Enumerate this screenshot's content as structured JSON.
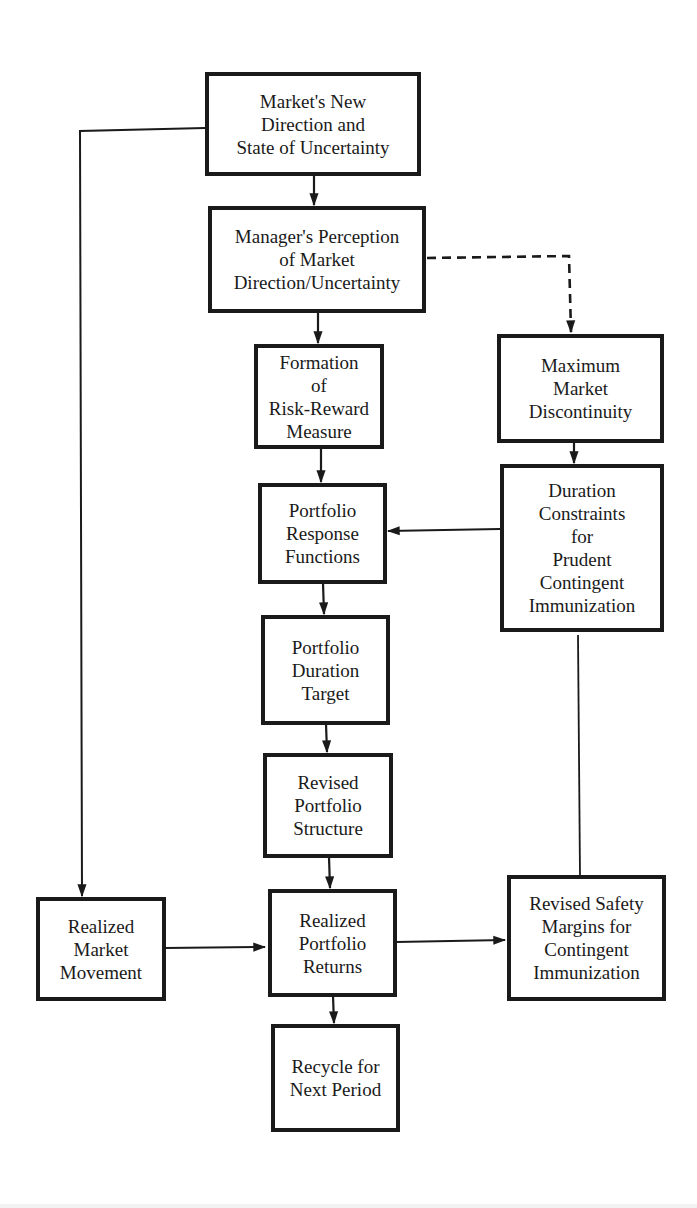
{
  "diagram": {
    "type": "flowchart",
    "colors": {
      "background": "#ffffff",
      "ink": "#1a1a1a"
    },
    "nodes": {
      "market_new_direction": {
        "label": "Market's New\nDirection  and\nState of Uncertainty"
      },
      "manager_perception": {
        "label": "Manager's Perception\nof  Market\nDirection/Uncertainty"
      },
      "risk_reward": {
        "label": "Formation\nof\nRisk-Reward\nMeasure"
      },
      "max_discontinuity": {
        "label": "Maximum\nMarket\nDiscontinuity"
      },
      "response_functions": {
        "label": "Portfolio\nResponse\nFunctions"
      },
      "duration_constraints": {
        "label": "Duration\nConstraints\nfor\nPrudent\nContingent\nImmunization"
      },
      "duration_target": {
        "label": "Portfolio\nDuration\nTarget"
      },
      "revised_structure": {
        "label": "Revised\nPortfolio\nStructure"
      },
      "realized_market": {
        "label": "Realized\nMarket\nMovement"
      },
      "realized_returns": {
        "label": "Realized\nPortfolio\nReturns"
      },
      "safety_margins": {
        "label": "Revised Safety\nMargins for\nContingent\nImmunization"
      },
      "recycle": {
        "label": "Recycle for\nNext Period"
      }
    },
    "edges": [
      {
        "from": "market_new_direction",
        "to": "manager_perception",
        "style": "solid"
      },
      {
        "from": "market_new_direction",
        "to": "realized_market",
        "style": "solid"
      },
      {
        "from": "manager_perception",
        "to": "risk_reward",
        "style": "solid"
      },
      {
        "from": "manager_perception",
        "to": "max_discontinuity",
        "style": "dashed"
      },
      {
        "from": "risk_reward",
        "to": "response_functions",
        "style": "solid"
      },
      {
        "from": "max_discontinuity",
        "to": "duration_constraints",
        "style": "solid"
      },
      {
        "from": "duration_constraints",
        "to": "response_functions",
        "style": "solid"
      },
      {
        "from": "duration_constraints",
        "to": "safety_margins",
        "style": "solid-no-arrow"
      },
      {
        "from": "response_functions",
        "to": "duration_target",
        "style": "solid"
      },
      {
        "from": "duration_target",
        "to": "revised_structure",
        "style": "solid"
      },
      {
        "from": "revised_structure",
        "to": "realized_returns",
        "style": "solid"
      },
      {
        "from": "realized_market",
        "to": "realized_returns",
        "style": "solid"
      },
      {
        "from": "realized_returns",
        "to": "safety_margins",
        "style": "solid"
      },
      {
        "from": "realized_returns",
        "to": "recycle",
        "style": "solid"
      }
    ]
  }
}
